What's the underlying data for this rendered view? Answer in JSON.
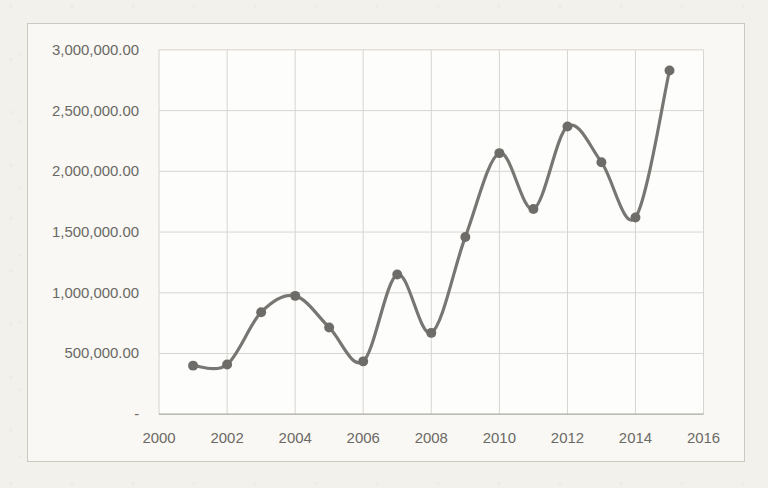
{
  "chart_data": {
    "type": "line",
    "smooth": true,
    "marker": "circle",
    "grid": true,
    "legend": false,
    "title": "",
    "xlabel": "",
    "ylabel": "",
    "x": [
      2001,
      2002,
      2003,
      2004,
      2005,
      2006,
      2007,
      2008,
      2009,
      2010,
      2011,
      2012,
      2013,
      2014,
      2015
    ],
    "values": [
      400000,
      410000,
      840000,
      975000,
      715000,
      435000,
      1150000,
      670000,
      1460000,
      2150000,
      1690000,
      2370000,
      2075000,
      1620000,
      2830000
    ],
    "x_axis": {
      "min": 2000,
      "max": 2016,
      "tick_values": [
        2000,
        2002,
        2004,
        2006,
        2008,
        2010,
        2012,
        2014,
        2016
      ],
      "tick_labels": [
        "2000",
        "2002",
        "2004",
        "2006",
        "2008",
        "2010",
        "2012",
        "2014",
        "2016"
      ]
    },
    "y_axis": {
      "min": 0,
      "max": 3000000,
      "tick_values": [
        3000000,
        2500000,
        2000000,
        1500000,
        1000000,
        500000,
        0
      ],
      "tick_labels": [
        "3,000,000.00",
        "2,500,000.00",
        "2,000,000.00",
        "1,500,000.00",
        "1,000,000.00",
        "500,000.00",
        "-"
      ]
    },
    "colors": {
      "line": "#787672",
      "marker": "#6e6c68",
      "gridline": "#d7d5d0",
      "axis_line": "#aaa7a2",
      "tick_label": "#6b6965",
      "plot_background": "#fdfdfb",
      "chart_background": "#f9f8f4",
      "chart_border": "#ccc9c3",
      "page_background": "#f3f1eb"
    }
  }
}
